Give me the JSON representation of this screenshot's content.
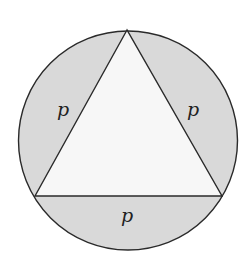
{
  "diagram": {
    "title": "",
    "colors": {
      "segment_fill": "#d9d9d9",
      "triangle_fill": "#f7f7f7",
      "stroke": "#2a2a2a",
      "background": "#ffffff"
    },
    "labels": {
      "left_segment": "p",
      "right_segment": "p",
      "bottom_segment": "p"
    }
  }
}
